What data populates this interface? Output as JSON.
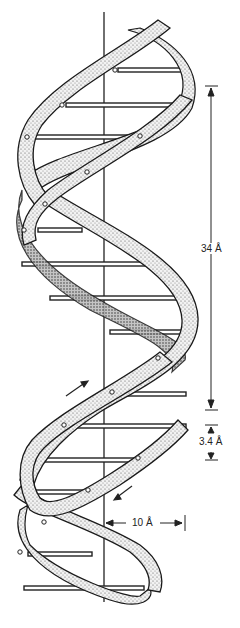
{
  "figure": {
    "labels": {
      "pitch": "34 Å",
      "rise": "3.4 Å",
      "radius": "10 Å"
    },
    "colors": {
      "ink": "#1a1a1a",
      "ribbon_fill": "#e6e6e6",
      "background": "#ffffff"
    },
    "annotations": {
      "pitch_arrow": "vertical double arrow spanning one helical turn",
      "rise_arrow": "vertical arrows marking distance between base pairs",
      "radius_arrow": "horizontal arrow from helix axis to outer edge",
      "strand_direction_arrows": [
        "up-right arrow on left strand",
        "down-left arrow on right strand"
      ]
    }
  }
}
